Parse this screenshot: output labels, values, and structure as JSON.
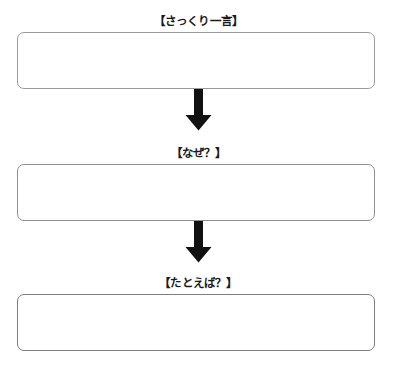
{
  "worksheet": {
    "sections": [
      {
        "label": "【さっくり一言】",
        "answer": ""
      },
      {
        "label": "【なぜ？】",
        "answer": ""
      },
      {
        "label": "【たとえば？】",
        "answer": ""
      }
    ],
    "connectors": [
      {
        "icon": "arrow-down-icon"
      },
      {
        "icon": "arrow-down-icon"
      }
    ],
    "colors": {
      "background": "#ffffff",
      "box_border": "#9a9a9a",
      "label_text": "#1a1a1a",
      "arrow_fill": "#111111"
    }
  }
}
